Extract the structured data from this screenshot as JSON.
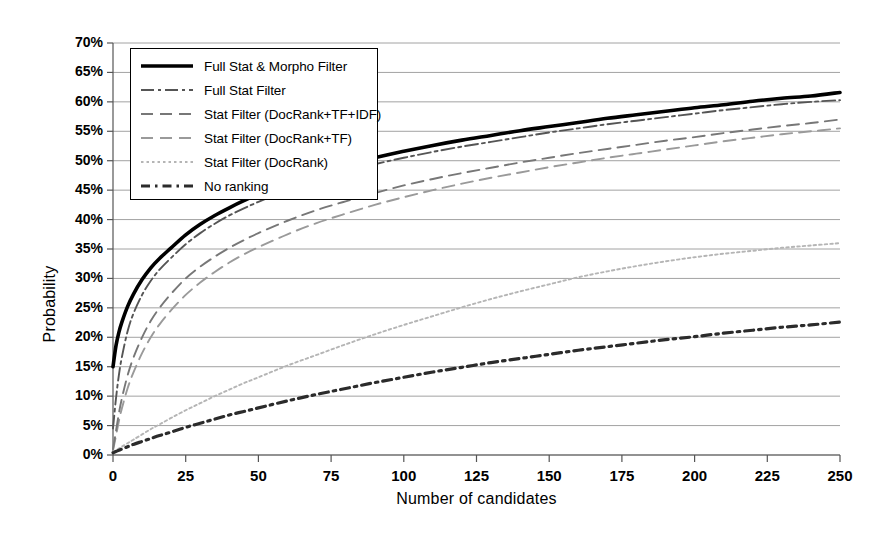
{
  "chart_data": {
    "type": "line",
    "title": "",
    "xlabel": "Number of candidates",
    "ylabel": "Probability",
    "xlim": [
      0,
      250
    ],
    "ylim": [
      0,
      70
    ],
    "xticks": [
      "0",
      "25",
      "50",
      "75",
      "100",
      "125",
      "150",
      "175",
      "200",
      "225",
      "250"
    ],
    "xtick_values": [
      0,
      25,
      50,
      75,
      100,
      125,
      150,
      175,
      200,
      225,
      250
    ],
    "yticks": [
      "0%",
      "5%",
      "10%",
      "15%",
      "20%",
      "25%",
      "30%",
      "35%",
      "40%",
      "45%",
      "50%",
      "55%",
      "60%",
      "65%",
      "70%"
    ],
    "ytick_values": [
      0,
      5,
      10,
      15,
      20,
      25,
      30,
      35,
      40,
      45,
      50,
      55,
      60,
      65,
      70
    ],
    "grid": "horizontal",
    "legend_position": "upper-left-inside",
    "x": [
      0,
      1,
      2,
      3,
      5,
      7,
      10,
      13,
      16,
      20,
      25,
      30,
      35,
      40,
      45,
      50,
      60,
      70,
      80,
      90,
      100,
      110,
      120,
      130,
      140,
      150,
      160,
      170,
      180,
      190,
      200,
      210,
      220,
      230,
      240,
      250
    ],
    "series": [
      {
        "name": "Full Stat & Morpho Filter",
        "style": "solid-thick",
        "color": "#000000",
        "values": [
          15.0,
          18.5,
          20.8,
          22.5,
          25.2,
          27.3,
          29.8,
          31.8,
          33.4,
          35.2,
          37.4,
          39.2,
          40.7,
          42.0,
          43.2,
          44.3,
          46.2,
          47.8,
          49.2,
          50.5,
          51.6,
          52.6,
          53.5,
          54.3,
          55.1,
          55.8,
          56.5,
          57.2,
          57.8,
          58.4,
          59.0,
          59.5,
          60.1,
          60.6,
          61.0,
          61.6
        ]
      },
      {
        "name": "Full Stat Filter",
        "style": "dash-dot",
        "color": "#555555",
        "values": [
          4.5,
          9.5,
          13.5,
          16.5,
          21.0,
          24.0,
          27.2,
          29.6,
          31.5,
          33.5,
          35.8,
          37.7,
          39.3,
          40.7,
          41.9,
          43.0,
          45.0,
          46.7,
          48.1,
          49.4,
          50.5,
          51.5,
          52.4,
          53.2,
          54.0,
          54.8,
          55.5,
          56.2,
          56.8,
          57.4,
          58.0,
          58.6,
          59.1,
          59.6,
          60.0,
          60.3
        ]
      },
      {
        "name": "Stat Filter (DocRank+TF+IDF)",
        "style": "dash",
        "color": "#777777",
        "values": [
          1.0,
          4.0,
          7.0,
          9.5,
          13.5,
          16.5,
          20.0,
          22.8,
          25.0,
          27.4,
          30.0,
          32.0,
          33.7,
          35.2,
          36.5,
          37.7,
          39.8,
          41.6,
          43.1,
          44.5,
          45.8,
          46.9,
          47.9,
          48.8,
          49.7,
          50.5,
          51.3,
          52.0,
          52.7,
          53.4,
          54.0,
          54.7,
          55.3,
          55.9,
          56.4,
          57.0
        ]
      },
      {
        "name": "Stat Filter (DocRank+TF)",
        "style": "dash",
        "color": "#9a9a9a",
        "values": [
          0.8,
          3.2,
          5.7,
          7.8,
          11.3,
          14.0,
          17.3,
          20.0,
          22.2,
          24.6,
          27.2,
          29.3,
          31.1,
          32.7,
          34.1,
          35.3,
          37.5,
          39.4,
          41.0,
          42.5,
          43.8,
          45.0,
          46.1,
          47.1,
          48.0,
          48.9,
          49.7,
          50.5,
          51.2,
          51.9,
          52.6,
          53.3,
          53.9,
          54.5,
          55.0,
          55.5
        ]
      },
      {
        "name": "Stat Filter (DocRank)",
        "style": "dotted",
        "color": "#b5b5b5",
        "values": [
          0.5,
          0.8,
          1.1,
          1.4,
          2.0,
          2.6,
          3.5,
          4.4,
          5.2,
          6.3,
          7.6,
          8.8,
          10.0,
          11.1,
          12.2,
          13.2,
          15.2,
          17.0,
          18.8,
          20.5,
          22.1,
          23.6,
          25.1,
          26.5,
          27.8,
          29.0,
          30.2,
          31.2,
          32.1,
          32.9,
          33.6,
          34.2,
          34.7,
          35.2,
          35.6,
          36.0
        ]
      },
      {
        "name": "No ranking",
        "style": "dash-dot-thick",
        "color": "#2b2b2b",
        "values": [
          0.4,
          0.6,
          0.8,
          1.0,
          1.4,
          1.8,
          2.3,
          2.8,
          3.3,
          3.9,
          4.7,
          5.4,
          6.1,
          6.8,
          7.4,
          8.0,
          9.2,
          10.3,
          11.3,
          12.3,
          13.2,
          14.1,
          14.9,
          15.7,
          16.4,
          17.1,
          17.8,
          18.4,
          19.0,
          19.6,
          20.1,
          20.7,
          21.2,
          21.7,
          22.1,
          22.6
        ]
      }
    ]
  },
  "legend": {
    "items": [
      {
        "label": "Full Stat & Morpho Filter"
      },
      {
        "label": "Full Stat Filter"
      },
      {
        "label": "Stat Filter (DocRank+TF+IDF)"
      },
      {
        "label": "Stat Filter (DocRank+TF)"
      },
      {
        "label": "Stat Filter (DocRank)"
      },
      {
        "label": "No ranking"
      }
    ]
  },
  "colors": {
    "grid": "#8a8a8a",
    "axis": "#555555",
    "background": "#ffffff"
  }
}
